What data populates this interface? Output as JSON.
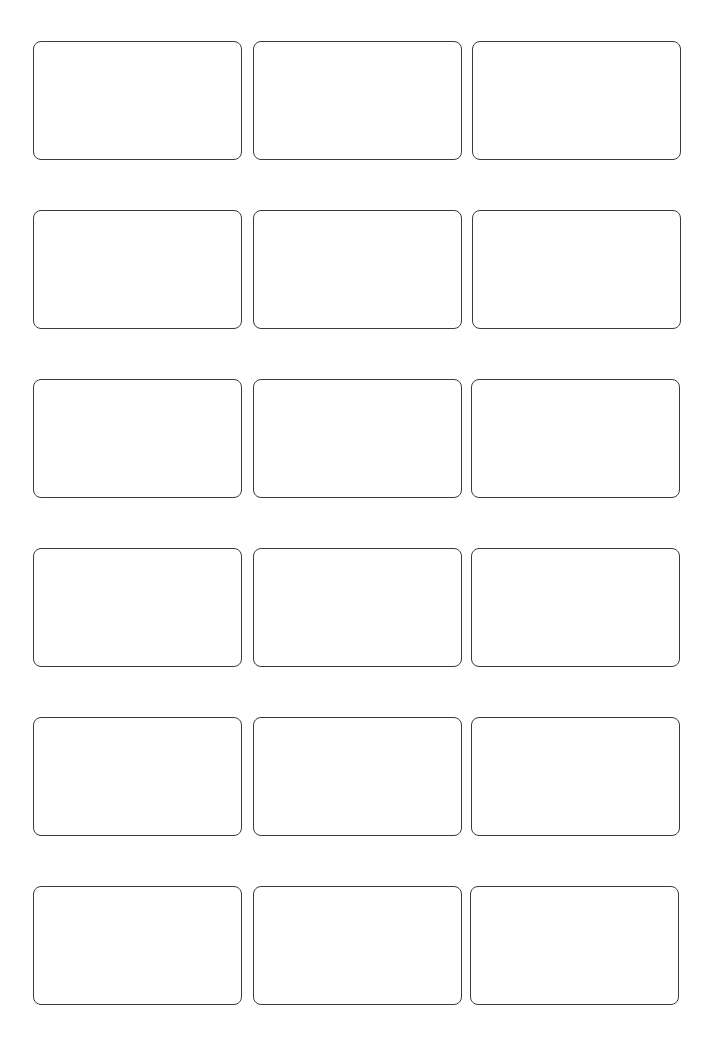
{
  "sheet": {
    "type": "label-template",
    "rows": 6,
    "columns": 3,
    "border_color": "#3a3a3a",
    "background_color": "#ffffff",
    "cards": [
      {
        "row": 1,
        "col": 1,
        "x": 33,
        "y": 41,
        "w": 209,
        "h": 119,
        "text": ""
      },
      {
        "row": 1,
        "col": 2,
        "x": 253,
        "y": 41,
        "w": 209,
        "h": 119,
        "text": ""
      },
      {
        "row": 1,
        "col": 3,
        "x": 472,
        "y": 41,
        "w": 209,
        "h": 119,
        "text": ""
      },
      {
        "row": 2,
        "col": 1,
        "x": 33,
        "y": 210,
        "w": 209,
        "h": 119,
        "text": ""
      },
      {
        "row": 2,
        "col": 2,
        "x": 253,
        "y": 210,
        "w": 209,
        "h": 119,
        "text": ""
      },
      {
        "row": 2,
        "col": 3,
        "x": 472,
        "y": 210,
        "w": 209,
        "h": 119,
        "text": ""
      },
      {
        "row": 3,
        "col": 1,
        "x": 33,
        "y": 379,
        "w": 209,
        "h": 119,
        "text": ""
      },
      {
        "row": 3,
        "col": 2,
        "x": 253,
        "y": 379,
        "w": 209,
        "h": 119,
        "text": ""
      },
      {
        "row": 3,
        "col": 3,
        "x": 471,
        "y": 379,
        "w": 209,
        "h": 119,
        "text": ""
      },
      {
        "row": 4,
        "col": 1,
        "x": 33,
        "y": 548,
        "w": 209,
        "h": 119,
        "text": ""
      },
      {
        "row": 4,
        "col": 2,
        "x": 253,
        "y": 548,
        "w": 209,
        "h": 119,
        "text": ""
      },
      {
        "row": 4,
        "col": 3,
        "x": 471,
        "y": 548,
        "w": 209,
        "h": 119,
        "text": ""
      },
      {
        "row": 5,
        "col": 1,
        "x": 33,
        "y": 717,
        "w": 209,
        "h": 119,
        "text": ""
      },
      {
        "row": 5,
        "col": 2,
        "x": 253,
        "y": 717,
        "w": 209,
        "h": 119,
        "text": ""
      },
      {
        "row": 5,
        "col": 3,
        "x": 471,
        "y": 717,
        "w": 209,
        "h": 119,
        "text": ""
      },
      {
        "row": 6,
        "col": 1,
        "x": 33,
        "y": 886,
        "w": 209,
        "h": 119,
        "text": ""
      },
      {
        "row": 6,
        "col": 2,
        "x": 253,
        "y": 886,
        "w": 209,
        "h": 119,
        "text": ""
      },
      {
        "row": 6,
        "col": 3,
        "x": 470,
        "y": 886,
        "w": 209,
        "h": 119,
        "text": ""
      }
    ]
  }
}
